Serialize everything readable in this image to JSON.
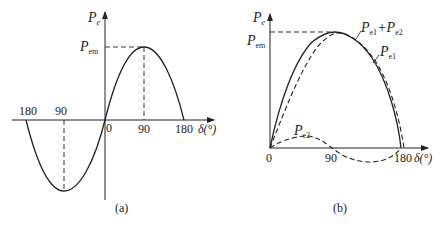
{
  "panel_a": {
    "caption": "(a)",
    "y_axis_label": "P",
    "y_axis_sub": "e",
    "pem_label": "P",
    "pem_sub": "em",
    "x_axis_label": "δ(°)",
    "origin_label": "0",
    "ticks_right": [
      "90",
      "180"
    ],
    "ticks_left": [
      "180",
      "90"
    ]
  },
  "panel_b": {
    "caption": "(b)",
    "y_axis_label": "P",
    "y_axis_sub": "e",
    "pem_label": "P",
    "pem_sub": "em",
    "x_axis_label": "δ(°)",
    "origin_label": "0",
    "ticks": [
      "90",
      "180"
    ],
    "curve_labels": {
      "sum_p1": "P",
      "sum_s1": "e1",
      "sum_plus": "+P",
      "sum_s2": "e2",
      "pe1_p": "P",
      "pe1_s": "e1",
      "pe2_p": "P",
      "pe2_s": "e2"
    }
  },
  "colors": {
    "stroke": "#222222",
    "background": "#ffffff"
  }
}
